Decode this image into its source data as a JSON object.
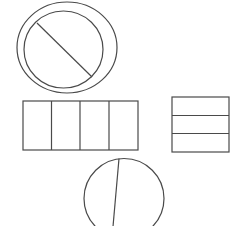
{
  "diagram": {
    "background": "#ffffff",
    "stroke_color": "#4a4a4a",
    "stroke_width": 1.2,
    "shapes": [
      {
        "id": "circle-with-ring",
        "type": "circle",
        "parts": 2,
        "division": "diagonal",
        "has_outer_ring": true,
        "outer_ring": {
          "cx": 67,
          "cy": 47.5,
          "rx": 50,
          "ry": 45.5
        },
        "inner_circle": {
          "cx": 63.5,
          "cy": 49.5,
          "rx": 39.5,
          "ry": 38.5
        },
        "divider": {
          "x1": 37,
          "y1": 23,
          "x2": 92,
          "y2": 77
        }
      },
      {
        "id": "rectangle-four-vertical",
        "type": "rectangle",
        "parts": 4,
        "division": "vertical",
        "rect": {
          "x": 23,
          "y": 101,
          "width": 115,
          "height": 49
        },
        "dividers_x": [
          51.5,
          80,
          109
        ]
      },
      {
        "id": "rectangle-three-horizontal",
        "type": "rectangle",
        "parts": 3,
        "division": "horizontal",
        "rect": {
          "x": 172,
          "y": 97,
          "width": 57,
          "height": 55
        },
        "dividers_y": [
          115.5,
          133.5
        ]
      },
      {
        "id": "circle-unequal-split",
        "type": "circle",
        "parts": 2,
        "division": "near-vertical, off-center",
        "circle": {
          "cx": 124,
          "cy": 198.5,
          "r": 40
        },
        "divider": {
          "x1": 119,
          "y1": 158.5,
          "x2": 112,
          "y2": 238
        }
      }
    ]
  }
}
